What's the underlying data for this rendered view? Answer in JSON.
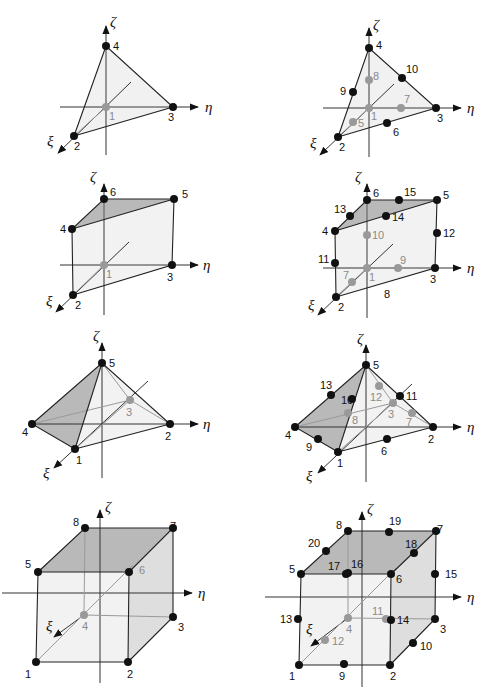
{
  "figure": {
    "axes": {
      "xi": "ξ",
      "eta": "η",
      "zeta": "ζ"
    },
    "colors": {
      "edge": "#222222",
      "hidden_node": "#999999",
      "top_face": "#b9b9b9",
      "side_face": "#dedede",
      "front_face": "#f2f2f2",
      "node": "#111111"
    }
  },
  "panels": [
    {
      "id": "tet4",
      "title": "Linear tetrahedron",
      "node_labels": [
        "1",
        "2",
        "3",
        "4"
      ]
    },
    {
      "id": "tet10",
      "title": "Quadratic tetrahedron",
      "node_labels": [
        "1",
        "2",
        "3",
        "4",
        "5",
        "6",
        "7",
        "8",
        "9",
        "10"
      ]
    },
    {
      "id": "wedge6",
      "title": "Linear wedge",
      "node_labels": [
        "1",
        "2",
        "3",
        "4",
        "5",
        "6"
      ]
    },
    {
      "id": "wedge15",
      "title": "Quadratic wedge",
      "node_labels": [
        "1",
        "2",
        "3",
        "4",
        "5",
        "6",
        "7",
        "8",
        "9",
        "10",
        "11",
        "12",
        "13",
        "14",
        "15"
      ]
    },
    {
      "id": "pyr5",
      "title": "Linear pyramid",
      "node_labels": [
        "1",
        "2",
        "3",
        "4",
        "5"
      ]
    },
    {
      "id": "pyr13",
      "title": "Quadratic pyramid",
      "node_labels": [
        "1",
        "2",
        "3",
        "4",
        "5",
        "6",
        "7",
        "8",
        "9",
        "10",
        "11",
        "12",
        "13"
      ]
    },
    {
      "id": "hex8",
      "title": "Linear hexahedron",
      "node_labels": [
        "1",
        "2",
        "3",
        "4",
        "5",
        "6",
        "7",
        "8"
      ]
    },
    {
      "id": "hex20",
      "title": "Quadratic hexahedron",
      "node_labels": [
        "1",
        "2",
        "3",
        "4",
        "5",
        "6",
        "7",
        "8",
        "9",
        "10",
        "11",
        "12",
        "13",
        "14",
        "15",
        "16",
        "17",
        "18",
        "19",
        "20"
      ]
    }
  ]
}
